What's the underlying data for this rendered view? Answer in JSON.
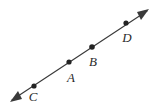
{
  "figure": {
    "kind": "geometry-line-diagram",
    "background_color": "#ffffff",
    "line_color": "#3a3a3a",
    "dot_color": "#232323",
    "label_color": "#2b2b2b",
    "canvas": {
      "width": 159,
      "height": 109
    },
    "line": {
      "name": "double-headed-line",
      "start": {
        "x": 12,
        "y": 100
      },
      "end": {
        "x": 147,
        "y": 11
      },
      "arrow_start": true,
      "arrow_end": true,
      "stroke_width": 1.15
    },
    "arrowheads": [
      {
        "name": "arrowhead-lower-left",
        "tip_x": 12,
        "tip_y": 100,
        "direction": "down-left"
      },
      {
        "name": "arrowhead-upper-right",
        "tip_x": 147,
        "tip_y": 11,
        "direction": "up-right"
      }
    ],
    "points": [
      {
        "id": "C",
        "label": "C",
        "dot_x": 34,
        "dot_y": 86,
        "radius": 2.6,
        "label_x": 33,
        "label_y": 101
      },
      {
        "id": "A",
        "label": "A",
        "dot_x": 69,
        "dot_y": 62,
        "radius": 2.6,
        "label_x": 67,
        "label_y": 82
      },
      {
        "id": "B",
        "label": "B",
        "dot_x": 92,
        "dot_y": 47,
        "radius": 2.8,
        "label_x": 87,
        "label_y": 67
      },
      {
        "id": "D",
        "label": "D",
        "dot_x": 126,
        "dot_y": 23,
        "radius": 2.6,
        "label_x": 122,
        "label_y": 42
      }
    ]
  }
}
